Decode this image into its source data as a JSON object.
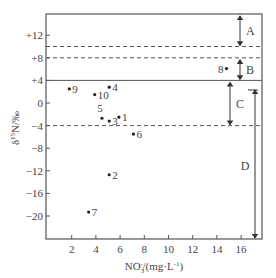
{
  "chart_data": {
    "type": "scatter",
    "title": "",
    "xlabel": "NO3-/(mg·L-1)",
    "xlabel_parts": {
      "main": "NO",
      "sub": "3",
      "sup": "-",
      "rest": "/(mg·L",
      "rest_sup": "-1",
      "close": ")"
    },
    "ylabel": "δ15N/‰",
    "ylabel_parts": {
      "delta": "δ",
      "sup": "15",
      "main": "N/‰"
    },
    "xlim": [
      0,
      17.5
    ],
    "ylim": [
      -24,
      16
    ],
    "xticks": [
      2,
      4,
      6,
      8,
      10,
      12,
      14,
      16
    ],
    "xtick_labels": [
      "2",
      "4",
      "6",
      "8",
      "10",
      "12",
      "14",
      "16"
    ],
    "yticks": [
      12,
      8,
      4,
      0,
      -4,
      -8,
      -12,
      -16,
      -20
    ],
    "ytick_labels": [
      "+12",
      "+8",
      "+4",
      "0",
      "−4",
      "−8",
      "−12",
      "−16",
      "−20"
    ],
    "grid": false,
    "legend": null,
    "points": [
      {
        "label": "1",
        "x": 5.9,
        "y": -2.5
      },
      {
        "label": "2",
        "x": 5.1,
        "y": -12.7
      },
      {
        "label": "3",
        "x": 5.1,
        "y": -3.2
      },
      {
        "label": "4",
        "x": 5.1,
        "y": 2.8
      },
      {
        "label": "5",
        "x": 4.5,
        "y": -2.7
      },
      {
        "label": "6",
        "x": 7.1,
        "y": -5.5
      },
      {
        "label": "7",
        "x": 3.4,
        "y": -19.3
      },
      {
        "label": "8",
        "x": 14.8,
        "y": 6.1
      },
      {
        "label": "9",
        "x": 1.8,
        "y": 2.5
      },
      {
        "label": "10",
        "x": 3.9,
        "y": 1.5
      }
    ],
    "reference_lines": [
      {
        "y": 10,
        "style": "dashed"
      },
      {
        "y": 8,
        "style": "dashed"
      },
      {
        "y": 4,
        "style": "solid"
      },
      {
        "y": -4,
        "style": "dashed"
      }
    ],
    "ranges": [
      {
        "label": "A",
        "y_from": 16,
        "y_to": 10,
        "x": 15.8
      },
      {
        "label": "B",
        "y_from": 8,
        "y_to": 4,
        "x": 15.8
      },
      {
        "label": "C",
        "y_from": 4,
        "y_to": -4,
        "x": 15.0
      },
      {
        "label": "D",
        "y_from": 2.2,
        "y_to": -24,
        "x": 17.0
      }
    ]
  }
}
